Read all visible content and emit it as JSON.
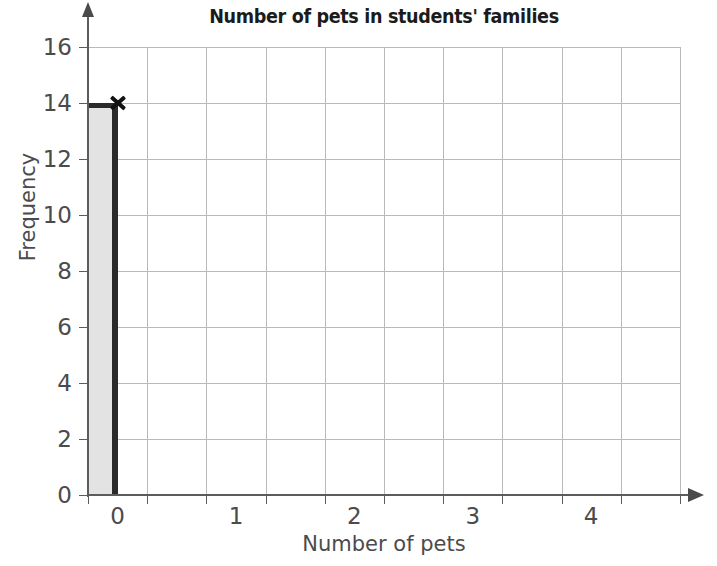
{
  "chart_data": {
    "type": "bar",
    "title": "Number of pets in students' families",
    "xlabel": "Number of pets",
    "ylabel": "Frequency",
    "categories": [
      "0"
    ],
    "values": [
      14
    ],
    "x": [
      0
    ],
    "xlim": [
      0,
      5
    ],
    "ylim": [
      0,
      16
    ],
    "x_ticks": [
      0,
      1,
      2,
      3,
      4
    ],
    "x_tick_labels": [
      "0",
      "1",
      "2",
      "3",
      "4"
    ],
    "y_ticks": [
      0,
      2,
      4,
      6,
      8,
      10,
      12,
      14,
      16
    ],
    "y_tick_labels": [
      "0",
      "2",
      "4",
      "6",
      "8",
      "10",
      "12",
      "14",
      "16"
    ],
    "grid": true,
    "grid_x_step": 0.5,
    "grid_y_step": 2,
    "legend": false,
    "bar_width": 0.25,
    "annotations": [
      {
        "type": "marker",
        "symbol": "x",
        "x": 0.25,
        "y": 14,
        "name": "data-point-marker"
      }
    ],
    "colors": {
      "bar_fill": "#e3e3e3",
      "bar_edge": "#2a2a2a",
      "gridline": "#b9b9bc",
      "axis": "#5c5c5c",
      "text": "#4b4b4b",
      "title": "#1b1b1b",
      "background": "#ffffff"
    }
  }
}
